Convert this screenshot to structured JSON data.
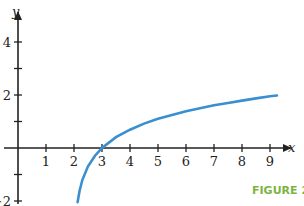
{
  "chart_data": {
    "type": "line",
    "title": "",
    "function": "y = ln(x - 2)",
    "xlabel": "x",
    "ylabel": "y",
    "xlim": [
      -0.3,
      9.6
    ],
    "ylim": [
      -2.1,
      4.8
    ],
    "x_ticks": [
      1,
      2,
      3,
      4,
      5,
      6,
      7,
      8,
      9
    ],
    "x_tick_labels": [
      "1",
      "2",
      "3",
      "4",
      "5",
      "6",
      "7",
      "8",
      "9"
    ],
    "y_ticks": [
      -2,
      -1,
      1,
      2,
      3,
      4
    ],
    "y_tick_labels": {
      "-2": "−2",
      "2": "2",
      "4": "4"
    },
    "grid": false,
    "series": [
      {
        "name": "curve",
        "color": "#3a8fd0",
        "x": [
          2.13,
          2.2,
          2.3,
          2.5,
          2.75,
          3,
          3.5,
          4,
          4.5,
          5,
          5.5,
          6,
          6.5,
          7,
          7.5,
          8,
          8.5,
          9,
          9.25
        ],
        "y": [
          -2.04,
          -1.61,
          -1.2,
          -0.69,
          -0.29,
          0,
          0.41,
          0.69,
          0.92,
          1.1,
          1.25,
          1.39,
          1.5,
          1.61,
          1.7,
          1.79,
          1.87,
          1.95,
          1.98
        ]
      }
    ]
  },
  "caption": {
    "text": "FIGURE 2.50."
  }
}
